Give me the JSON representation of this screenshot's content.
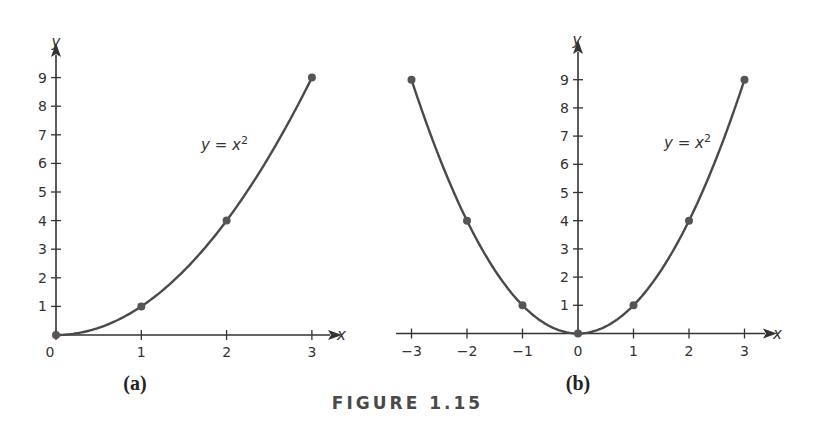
{
  "figure": {
    "caption": "FIGURE 1.15"
  },
  "chart_data": [
    {
      "type": "line",
      "panel_label": "(a)",
      "title": "",
      "equation_label": "y = x²",
      "xlabel": "x",
      "ylabel": "y",
      "x_ticks": [
        "0",
        "1",
        "2",
        "3"
      ],
      "y_ticks": [
        "1",
        "2",
        "3",
        "4",
        "5",
        "6",
        "7",
        "8",
        "9"
      ],
      "xlim": [
        0,
        3.3
      ],
      "ylim": [
        0,
        9.7
      ],
      "grid": false,
      "series": [
        {
          "name": "y = x^2",
          "function": "x^2",
          "domain": [
            0,
            3
          ],
          "points": [
            {
              "x": 0,
              "y": 0
            },
            {
              "x": 1,
              "y": 1
            },
            {
              "x": 2,
              "y": 4
            },
            {
              "x": 3,
              "y": 9
            }
          ]
        }
      ]
    },
    {
      "type": "line",
      "panel_label": "(b)",
      "title": "",
      "equation_label": "y = x²",
      "xlabel": "x",
      "ylabel": "y",
      "x_ticks": [
        "−3",
        "−2",
        "−1",
        "0",
        "1",
        "2",
        "3"
      ],
      "y_ticks": [
        "1",
        "2",
        "3",
        "4",
        "5",
        "6",
        "7",
        "8",
        "9"
      ],
      "xlim": [
        -3.3,
        3.3
      ],
      "ylim": [
        0,
        9.7
      ],
      "grid": false,
      "series": [
        {
          "name": "y = x^2",
          "function": "x^2",
          "domain": [
            -3,
            3
          ],
          "points": [
            {
              "x": -3,
              "y": 9
            },
            {
              "x": -2,
              "y": 4
            },
            {
              "x": -1,
              "y": 1
            },
            {
              "x": 0,
              "y": 0
            },
            {
              "x": 1,
              "y": 1
            },
            {
              "x": 2,
              "y": 4
            },
            {
              "x": 3,
              "y": 9
            }
          ]
        }
      ]
    }
  ],
  "colors": {
    "curve": "#4a4a4a",
    "axis": "#333333",
    "point": "#555555",
    "text": "#333333"
  }
}
